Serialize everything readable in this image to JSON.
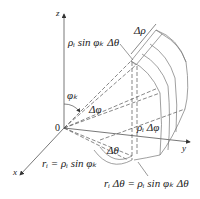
{
  "diagram": {
    "type": "spherical-coordinates-volume-element",
    "axes": {
      "z": "z",
      "x": "x",
      "y": "y",
      "origin": "0"
    },
    "labels": {
      "rho_sin_phi_dtheta": "ρᵢ sin φₖ Δθ",
      "delta_rho": "Δρ",
      "phi_k": "φₖ",
      "delta_phi": "Δφ",
      "rho_delta_phi": "ρᵢ Δφ",
      "delta_theta": "Δθ",
      "r_i_equation": "rᵢ = ρᵢ sin φₖ",
      "arc_equation": "rᵢ Δθ = ρᵢ sin φₖ Δθ"
    },
    "colors": {
      "line": "#555555",
      "text": "#222222",
      "background": "#ffffff"
    }
  }
}
